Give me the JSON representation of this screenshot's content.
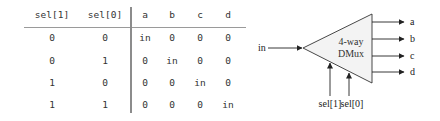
{
  "truth_table": {
    "headers": [
      "sel[1]",
      "sel[0]",
      "a",
      "b",
      "c",
      "d"
    ],
    "rows": [
      [
        "0",
        "0",
        "in",
        "0",
        "0",
        "0"
      ],
      [
        "0",
        "1",
        "0",
        "in",
        "0",
        "0"
      ],
      [
        "1",
        "0",
        "0",
        "0",
        "in",
        "0"
      ],
      [
        "1",
        "1",
        "0",
        "0",
        "0",
        "in"
      ]
    ]
  },
  "diagram": {
    "block_title_line1": "4-way",
    "block_title_line2": "DMux",
    "input_label": "in",
    "outputs": [
      "a",
      "b",
      "c",
      "d"
    ],
    "selectors": [
      "sel[1]",
      "sel[0]"
    ],
    "colors": {
      "block_fill": "#f3f3f3",
      "stroke": "#222222",
      "text": "#222222"
    }
  }
}
